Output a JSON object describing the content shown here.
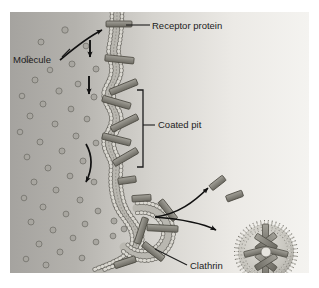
{
  "figure": {
    "background": {
      "left_color": "#a9a9a7",
      "right_color": "#f2f2f0",
      "border_color": "#ffffff"
    },
    "palette": {
      "membrane_head": "#cfcdc6",
      "membrane_outline": "#6e6c66",
      "membrane_tail": "#b6b4ad",
      "clathrin_fill": "#8e8c84",
      "clathrin_outline": "#4a4840",
      "molecule_fill": "#a8a6a0",
      "molecule_outline": "#706e68",
      "arrow_color": "#111111",
      "text_color": "#1c1c1c",
      "leader_color": "#1c1c1c"
    },
    "labels": [
      {
        "id": "receptor-protein",
        "text": "Receptor protein",
        "x": 142,
        "y": 15
      },
      {
        "id": "molecule",
        "text": "Molecule",
        "x": 12,
        "y": 48
      },
      {
        "id": "coated-pit",
        "text": "Coated pit",
        "x": 148,
        "y": 113
      },
      {
        "id": "clathrin",
        "text": "Clathrin",
        "x": 180,
        "y": 254
      }
    ],
    "structures": {
      "membrane": "phospholipid-bilayer",
      "coated_pit_bracket": {
        "top": 78,
        "bottom": 155,
        "x": 133
      },
      "vesicle": {
        "cx": 256,
        "cy": 240,
        "r": 31,
        "spokes": 8
      },
      "free_clathrin_bars": [
        {
          "x": 207,
          "y": 172,
          "angle": -38
        },
        {
          "x": 224,
          "y": 183,
          "angle": -22
        }
      ]
    },
    "molecule_count": 46,
    "arrows": [
      {
        "id": "molecule-to-receptor",
        "type": "curved"
      },
      {
        "id": "receptor-migration-1",
        "type": "straight-down"
      },
      {
        "id": "receptor-migration-2",
        "type": "straight-down"
      },
      {
        "id": "membrane-invagination",
        "type": "curved-down"
      },
      {
        "id": "uncoating-to-clathrin",
        "type": "curved-up"
      },
      {
        "id": "uncoating-to-vesicle",
        "type": "curved-down"
      }
    ]
  }
}
